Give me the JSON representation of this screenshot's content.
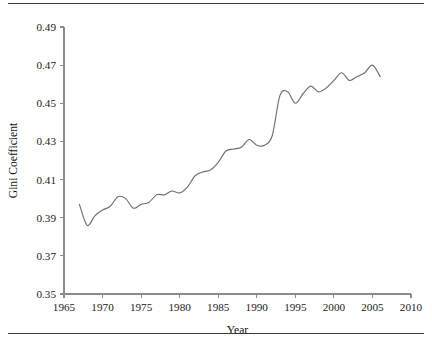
{
  "figure": {
    "top_rule": "horizontal-rule",
    "bottom_rule": "horizontal-rule"
  },
  "chart_data": {
    "type": "line",
    "title": "",
    "subtitle": "",
    "xlabel": "Year",
    "ylabel": "Gini Coefficient",
    "xlim": [
      1965,
      2010
    ],
    "ylim": [
      0.35,
      0.49
    ],
    "xticks": [
      1965,
      1970,
      1975,
      1980,
      1985,
      1990,
      1995,
      2000,
      2005,
      2010
    ],
    "xtick_labels": [
      "1965",
      "1970",
      "1975",
      "1980",
      "1985",
      "1990",
      "1995",
      "2000",
      "2005",
      "2010"
    ],
    "yticks": [
      0.35,
      0.37,
      0.39,
      0.41,
      0.43,
      0.45,
      0.47,
      0.49
    ],
    "ytick_labels": [
      "0.35",
      "0.37",
      "0.39",
      "0.41",
      "0.43",
      "0.45",
      "0.47",
      "0.49"
    ],
    "grid": false,
    "legend": false,
    "legend_position": "none",
    "line_color": "#6e6e6e",
    "series": [
      {
        "name": "Gini Coefficient",
        "x": [
          1967,
          1968,
          1969,
          1970,
          1971,
          1972,
          1973,
          1974,
          1975,
          1976,
          1977,
          1978,
          1979,
          1980,
          1981,
          1982,
          1983,
          1984,
          1985,
          1986,
          1987,
          1988,
          1989,
          1990,
          1991,
          1992,
          1993,
          1994,
          1995,
          1996,
          1997,
          1998,
          1999,
          2000,
          2001,
          2002,
          2003,
          2004,
          2005,
          2006
        ],
        "values": [
          0.397,
          0.386,
          0.391,
          0.394,
          0.396,
          0.401,
          0.4,
          0.395,
          0.397,
          0.398,
          0.402,
          0.402,
          0.404,
          0.403,
          0.406,
          0.412,
          0.414,
          0.415,
          0.419,
          0.425,
          0.426,
          0.427,
          0.431,
          0.428,
          0.428,
          0.433,
          0.454,
          0.456,
          0.45,
          0.455,
          0.459,
          0.456,
          0.458,
          0.462,
          0.466,
          0.462,
          0.464,
          0.466,
          0.47,
          0.464
        ]
      }
    ]
  }
}
